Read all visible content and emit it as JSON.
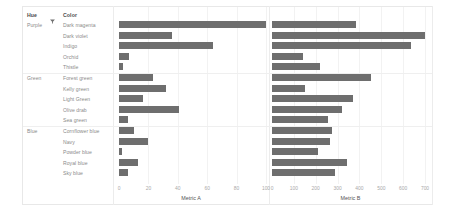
{
  "table": {
    "headers": {
      "hue": "Hue",
      "color": "Color"
    },
    "sort_icon": "sort-descending-icon"
  },
  "axes": {
    "metric_a": {
      "title": "Metric A",
      "ticks": [
        "0",
        "20",
        "40",
        "60",
        "80",
        "100"
      ],
      "min": 0,
      "max": 100
    },
    "metric_b": {
      "title": "Metric B",
      "ticks": [
        "0",
        "100",
        "200",
        "300",
        "400",
        "500",
        "600",
        "700"
      ],
      "min": 0,
      "max": 700
    }
  },
  "groups": [
    {
      "hue": "Purple",
      "count": 5
    },
    {
      "hue": "Green",
      "count": 5
    },
    {
      "hue": "Blue",
      "count": 5
    }
  ],
  "rows": [
    {
      "hue": "Purple",
      "color": "Dark magenta",
      "metric_a": 100,
      "metric_b": 385
    },
    {
      "hue": "",
      "color": "Dark violet",
      "metric_a": 36,
      "metric_b": 700
    },
    {
      "hue": "",
      "color": "Indigo",
      "metric_a": 64,
      "metric_b": 635
    },
    {
      "hue": "",
      "color": "Orchid",
      "metric_a": 7,
      "metric_b": 140
    },
    {
      "hue": "",
      "color": "Thistle",
      "metric_a": 3,
      "metric_b": 220
    },
    {
      "hue": "Green",
      "color": "Forest green",
      "metric_a": 23,
      "metric_b": 455
    },
    {
      "hue": "",
      "color": "Kelly green",
      "metric_a": 32,
      "metric_b": 150
    },
    {
      "hue": "",
      "color": "Light Green",
      "metric_a": 16,
      "metric_b": 370
    },
    {
      "hue": "",
      "color": "Olive drab",
      "metric_a": 41,
      "metric_b": 320
    },
    {
      "hue": "",
      "color": "Sea green",
      "metric_a": 6,
      "metric_b": 255
    },
    {
      "hue": "Blue",
      "color": "Cornflower blue",
      "metric_a": 10,
      "metric_b": 275
    },
    {
      "hue": "",
      "color": "Navy",
      "metric_a": 20,
      "metric_b": 265
    },
    {
      "hue": "",
      "color": "Powder blue",
      "metric_a": 2,
      "metric_b": 210
    },
    {
      "hue": "",
      "color": "Royal blue",
      "metric_a": 13,
      "metric_b": 345
    },
    {
      "hue": "",
      "color": "Sky blue",
      "metric_a": 6,
      "metric_b": 290
    }
  ],
  "colors": {
    "bar": "#6e6e6e",
    "frame": "#e8e8e8",
    "label": "#8a8a8a",
    "header": "#4a4a4a",
    "tick": "#a8a8a8"
  },
  "chart_data": {
    "type": "bar",
    "title": "",
    "orientation": "horizontal",
    "categories": [
      "Dark magenta",
      "Dark violet",
      "Indigo",
      "Orchid",
      "Thistle",
      "Forest green",
      "Kelly green",
      "Light Green",
      "Olive drab",
      "Sea green",
      "Cornflower blue",
      "Navy",
      "Powder blue",
      "Royal blue",
      "Sky blue"
    ],
    "group_by": "Hue",
    "groups": [
      "Purple",
      "Purple",
      "Purple",
      "Purple",
      "Purple",
      "Green",
      "Green",
      "Green",
      "Green",
      "Green",
      "Blue",
      "Blue",
      "Blue",
      "Blue",
      "Blue"
    ],
    "series": [
      {
        "name": "Metric A",
        "values": [
          100,
          36,
          64,
          7,
          3,
          23,
          32,
          16,
          41,
          6,
          10,
          20,
          2,
          13,
          6
        ],
        "xlabel": "Metric A",
        "xlim": [
          0,
          100
        ],
        "ticks": [
          0,
          20,
          40,
          60,
          80,
          100
        ]
      },
      {
        "name": "Metric B",
        "values": [
          385,
          700,
          635,
          140,
          220,
          455,
          150,
          370,
          320,
          255,
          275,
          265,
          210,
          345,
          290
        ],
        "xlabel": "Metric B",
        "xlim": [
          0,
          700
        ],
        "ticks": [
          0,
          100,
          200,
          300,
          400,
          500,
          600,
          700
        ]
      }
    ],
    "ylabel": "Color",
    "grid": true,
    "legend": "none"
  }
}
